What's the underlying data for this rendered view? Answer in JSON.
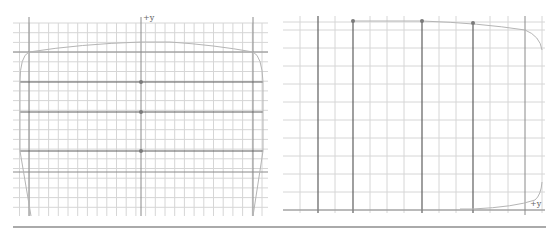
{
  "figure": {
    "left_panel": {
      "axis_label": "+y",
      "grid": {
        "x0": 13,
        "x1": 268,
        "y0": 23,
        "y1": 216,
        "spacing": 9.7
      },
      "y_axis_x": 141,
      "frame_verticals_x": [
        29,
        253
      ],
      "axis_horizontals_y": [
        52,
        172
      ],
      "dark_horizontals_y": [
        82,
        112,
        151
      ],
      "dots": [
        [
          141,
          82
        ],
        [
          141,
          112
        ],
        [
          141,
          151
        ]
      ],
      "curve_path": "M29,52 Q80,44 141,42 L170,42 Q215,45 253,52 Q262,56 263,82 L263,151 L253,216 M29,52 Q20,56 20,82 L20,151 L31,216"
    },
    "right_panel": {
      "axis_label": "+y",
      "grid_h_y": [
        22,
        30,
        48,
        66,
        84,
        102,
        120,
        138,
        156,
        174,
        192,
        210
      ],
      "grid_v_x": [
        300,
        335,
        370,
        387,
        404,
        439,
        456,
        490,
        508,
        542
      ],
      "grid_x0": 283,
      "grid_x1": 545,
      "grid_y0": 16,
      "grid_y1": 213,
      "dark_verticals_x": [
        318,
        353,
        422,
        473
      ],
      "axis_vertical_x": 525,
      "dots": [
        [
          353,
          21
        ],
        [
          422,
          21
        ],
        [
          473,
          23
        ]
      ],
      "curve_path": "M353,21 L422,21 Q480,23 525,30 Q540,36 542,50 M460,209 L473,209 Q515,207 535,200 Q541,195 542,182"
    },
    "separator": {
      "x1": 13,
      "x2": 546,
      "y": 227
    }
  }
}
